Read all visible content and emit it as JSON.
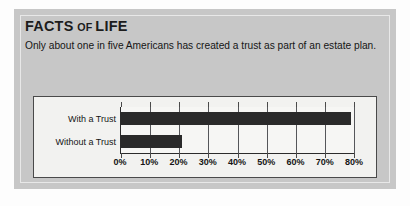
{
  "card": {
    "title_main_1": "FACTS",
    "title_small": "OF",
    "title_main_2": "LIFE",
    "blurb": "Only about one in five Americans has created a trust as part of an estate plan."
  },
  "colors": {
    "panel_bg": "#c7c7c7",
    "panel_inset": "#e8e8e8",
    "chart_bg": "#f2f2f0",
    "plot_bg": "#f6f6f4",
    "bar": "#2a2a2a",
    "axis": "#2b2b2b",
    "grid": "#55565a",
    "text": "#151515"
  },
  "chart_data": {
    "type": "bar",
    "orientation": "horizontal",
    "title": "",
    "subtitle": "",
    "xlabel": "",
    "ylabel": "",
    "categories": [
      "With a Trust",
      "Without a Trust"
    ],
    "values": [
      79,
      21
    ],
    "unit": "%",
    "xlim": [
      0,
      80
    ],
    "xticks": [
      0,
      10,
      20,
      30,
      40,
      50,
      60,
      70,
      80
    ],
    "xtick_labels": [
      "0%",
      "10%",
      "20%",
      "30%",
      "40%",
      "50%",
      "60%",
      "70%",
      "80%"
    ],
    "grid": true,
    "grid_axis": "x",
    "legend": false,
    "legend_position": "none",
    "series": [
      {
        "name": "Share of Americans",
        "values": [
          79,
          21
        ]
      }
    ]
  }
}
